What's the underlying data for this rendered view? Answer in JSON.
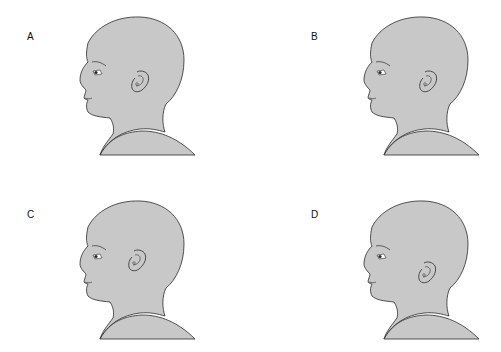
{
  "figure": {
    "colors": {
      "skin": "#c8c8c8",
      "outline": "#2a2a2a",
      "background": "#ffffff"
    },
    "panels": [
      {
        "id": "A",
        "label": "A",
        "ear_position": "normal",
        "ear_offset_x": 0,
        "ear_offset_y": 0
      },
      {
        "id": "B",
        "label": "B",
        "ear_position": "low-set / posteriorly rotated",
        "ear_offset_x": 4,
        "ear_offset_y": 0
      },
      {
        "id": "C",
        "label": "C",
        "ear_position": "high-set",
        "ear_offset_x": -3,
        "ear_offset_y": -5
      },
      {
        "id": "D",
        "label": "D",
        "ear_position": "low-set",
        "ear_offset_x": 3,
        "ear_offset_y": 7
      }
    ]
  }
}
